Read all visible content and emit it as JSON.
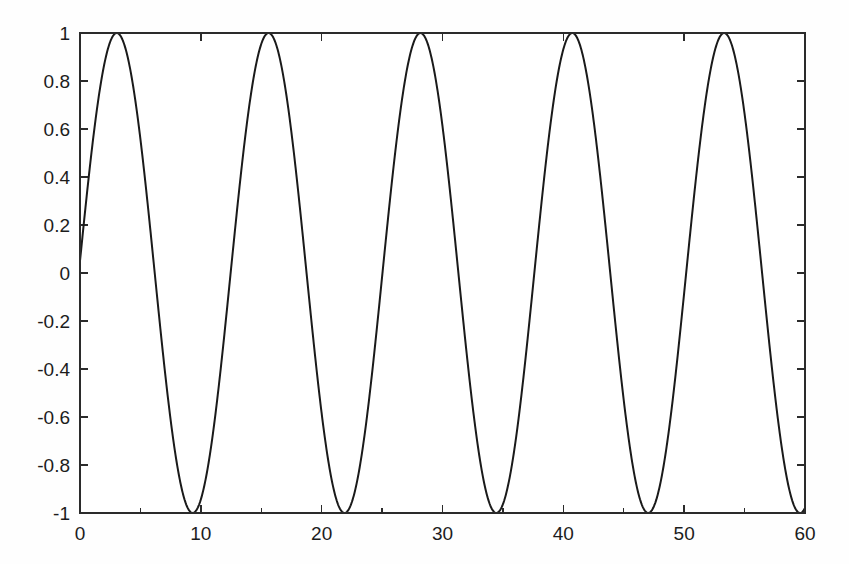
{
  "chart_data": {
    "type": "line",
    "title": "",
    "subtitle": "",
    "xlabel": "",
    "ylabel": "",
    "xlim": [
      0,
      60
    ],
    "ylim": [
      -1,
      1
    ],
    "grid": false,
    "legend": null,
    "background_color": "#ffffff",
    "line_color": "#1a1a1a",
    "axis_color": "#2b2b2b",
    "x_ticks": [
      0,
      10,
      20,
      30,
      40,
      50,
      60
    ],
    "x_tick_labels": [
      "0",
      "10",
      "20",
      "30",
      "40",
      "50",
      "60"
    ],
    "x_minor_ticks": [
      5,
      15,
      25,
      35,
      45,
      55
    ],
    "y_ticks": [
      -1,
      -0.8,
      -0.6,
      -0.4,
      -0.2,
      0,
      0.2,
      0.4,
      0.6,
      0.8,
      1
    ],
    "y_tick_labels": [
      "-1",
      "-0.8",
      "-0.6",
      "-0.4",
      "-0.2",
      "0",
      "0.2",
      "0.4",
      "0.6",
      "0.8",
      "1"
    ],
    "series": [
      {
        "name": "sine",
        "formula": "sin(0.5*x + 0.05)",
        "amplitude": 1,
        "angular_frequency": 0.5,
        "phase": 0.05,
        "period": 12.566,
        "num_cycles": 5,
        "peaks_x": [
          3.0,
          15.6,
          28.2,
          40.7,
          53.3
        ],
        "peaks_y": [
          1,
          1,
          1,
          1,
          1
        ],
        "troughs_x": [
          9.4,
          21.9,
          34.5,
          47.1,
          59.6
        ],
        "troughs_y": [
          -1,
          -1,
          -1,
          -1,
          -1
        ],
        "x_start": 0,
        "x_end": 60,
        "y_at_x_start": 0.05,
        "samples": 1201
      }
    ]
  },
  "figure": {
    "plot_left_px": 80,
    "plot_right_px": 805,
    "plot_top_px": 33,
    "plot_bottom_px": 513
  }
}
